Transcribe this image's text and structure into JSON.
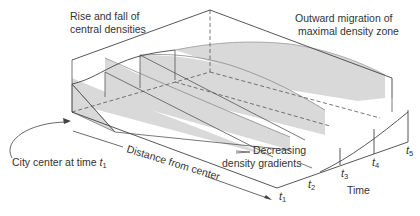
{
  "figure": {
    "labels": {
      "rise_fall_line1": "Rise and fall of",
      "rise_fall_line2": "central densities",
      "outward_line1": "Outward migration of",
      "outward_line2": "maximal density zone",
      "city_center": "City center at time ",
      "distance_axis": "Distance from center",
      "decreasing_line1": "Decreasing",
      "decreasing_line2": "density gradients",
      "time_axis": "Time"
    },
    "time_ticks": [
      {
        "t": "t",
        "sub": "1"
      },
      {
        "t": "t",
        "sub": "2"
      },
      {
        "t": "t",
        "sub": "3"
      },
      {
        "t": "t",
        "sub": "4"
      },
      {
        "t": "t",
        "sub": "5"
      }
    ],
    "colors": {
      "fill": "#d9d9d9",
      "stroke": "#444444",
      "text": "#333333"
    }
  }
}
